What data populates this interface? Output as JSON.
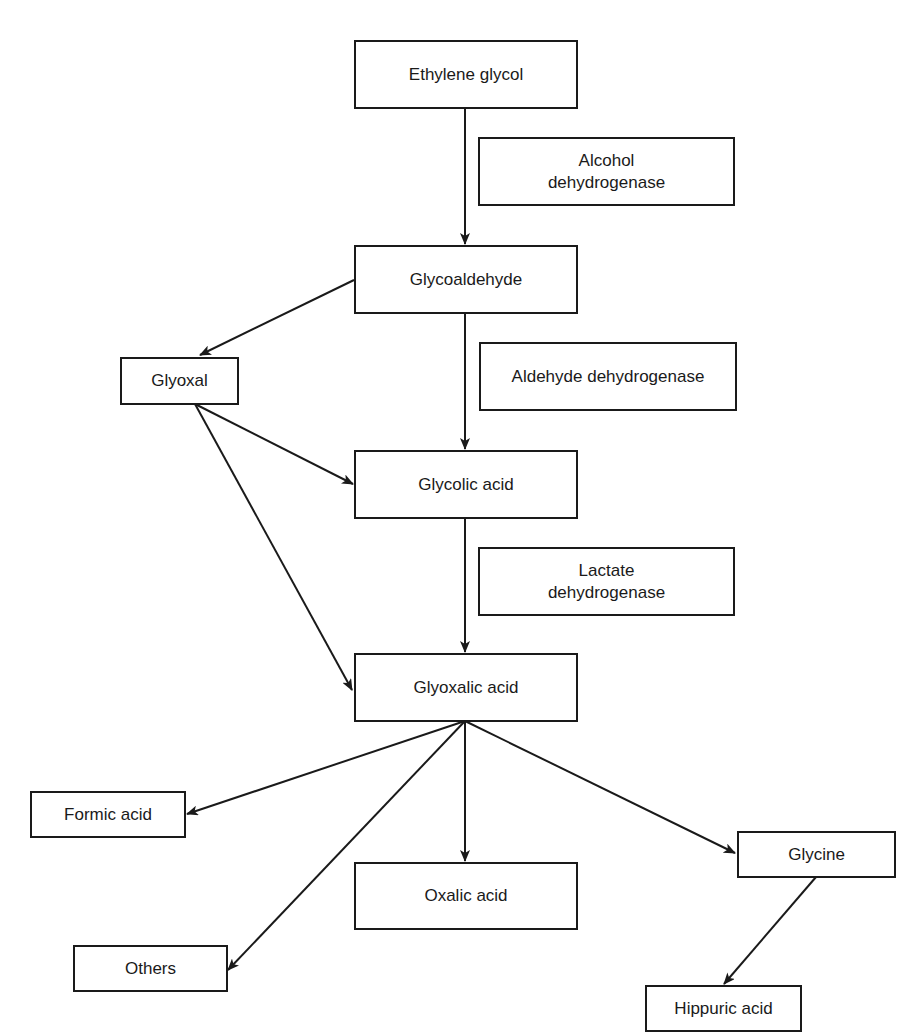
{
  "diagram": {
    "type": "metabolic-pathway",
    "nodes": {
      "ethylene_glycol": {
        "label": "Ethylene glycol"
      },
      "glycoaldehyde": {
        "label": "Glycoaldehyde"
      },
      "glyoxal": {
        "label": "Glyoxal"
      },
      "glycolic_acid": {
        "label": "Glycolic acid"
      },
      "glyoxalic_acid": {
        "label": "Glyoxalic acid"
      },
      "formic_acid": {
        "label": "Formic acid"
      },
      "oxalic_acid": {
        "label": "Oxalic acid"
      },
      "glycine": {
        "label": "Glycine"
      },
      "others": {
        "label": "Others"
      },
      "hippuric_acid": {
        "label": "Hippuric acid"
      }
    },
    "enzymes": {
      "alcohol_dh": {
        "line1": "Alcohol",
        "line2": "dehydrogenase"
      },
      "aldehyde_dh": {
        "label": "Aldehyde dehydrogenase"
      },
      "lactate_dh": {
        "line1": "Lactate",
        "line2": "dehydrogenase"
      }
    },
    "edges": [
      {
        "from": "Ethylene glycol",
        "to": "Glycoaldehyde",
        "enzyme": "Alcohol dehydrogenase"
      },
      {
        "from": "Glycoaldehyde",
        "to": "Glyoxal"
      },
      {
        "from": "Glycoaldehyde",
        "to": "Glycolic acid",
        "enzyme": "Aldehyde dehydrogenase"
      },
      {
        "from": "Glyoxal",
        "to": "Glycolic acid"
      },
      {
        "from": "Glyoxal",
        "to": "Glyoxalic acid"
      },
      {
        "from": "Glycolic acid",
        "to": "Glyoxalic acid",
        "enzyme": "Lactate dehydrogenase"
      },
      {
        "from": "Glyoxalic acid",
        "to": "Formic acid"
      },
      {
        "from": "Glyoxalic acid",
        "to": "Others"
      },
      {
        "from": "Glyoxalic acid",
        "to": "Oxalic acid"
      },
      {
        "from": "Glyoxalic acid",
        "to": "Glycine"
      },
      {
        "from": "Glycine",
        "to": "Hippuric acid"
      }
    ],
    "colors": {
      "line": "#1a1a1a",
      "background": "#ffffff"
    }
  }
}
